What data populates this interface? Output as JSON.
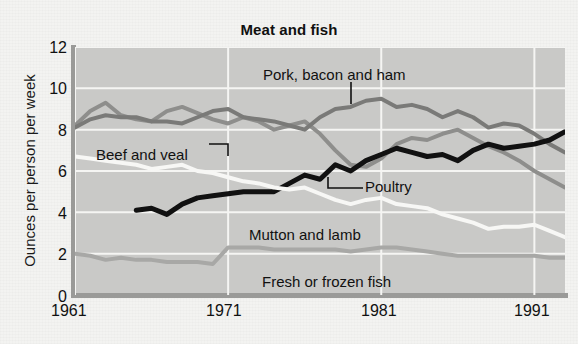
{
  "chart_data": {
    "type": "line",
    "title": "Meat and fish",
    "xlabel": "",
    "ylabel": "Ounces per person per week",
    "xlim": [
      1961,
      1993
    ],
    "ylim": [
      0,
      12
    ],
    "ytick_labels": [
      "0",
      "2",
      "4",
      "6",
      "8",
      "10",
      "12"
    ],
    "ytick_values": [
      0,
      2,
      4,
      6,
      8,
      10,
      12
    ],
    "xtick_labels": [
      "1961",
      "1971",
      "1981",
      "1991"
    ],
    "xtick_values": [
      1961,
      1971,
      1981,
      1991
    ],
    "grid": true,
    "legend_position": "inline-callouts",
    "plot_bg_color": "#c9c9c7",
    "gridline_color": "#f5f5f3",
    "x": [
      1961,
      1962,
      1963,
      1964,
      1965,
      1966,
      1967,
      1968,
      1969,
      1970,
      1971,
      1972,
      1973,
      1974,
      1975,
      1976,
      1977,
      1978,
      1979,
      1980,
      1981,
      1982,
      1983,
      1984,
      1985,
      1986,
      1987,
      1988,
      1989,
      1990,
      1991,
      1992,
      1993
    ],
    "series": [
      {
        "name": "Beef and veal",
        "color": "#8e8e8c",
        "label_anchor_year": 1968,
        "values": [
          8.2,
          8.9,
          9.3,
          8.7,
          8.5,
          8.4,
          8.9,
          9.1,
          8.8,
          8.5,
          8.3,
          8.6,
          8.4,
          8.0,
          8.2,
          8.4,
          7.8,
          7.0,
          6.3,
          6.2,
          6.6,
          7.3,
          7.6,
          7.5,
          7.8,
          8.0,
          7.6,
          7.2,
          6.9,
          6.5,
          6.0,
          5.6,
          5.2
        ]
      },
      {
        "name": "Pork, bacon and ham",
        "color": "#7a7a78",
        "label_anchor_year": 1977,
        "values": [
          8.1,
          8.5,
          8.7,
          8.6,
          8.6,
          8.4,
          8.4,
          8.3,
          8.6,
          8.9,
          9.0,
          8.6,
          8.5,
          8.4,
          8.2,
          8.0,
          8.6,
          9.0,
          9.1,
          9.4,
          9.5,
          9.1,
          9.2,
          9.0,
          8.6,
          8.9,
          8.6,
          8.1,
          8.3,
          8.2,
          7.8,
          7.3,
          6.9
        ]
      },
      {
        "name": "Poultry",
        "color": "#111111",
        "label_anchor_year": 1978,
        "values": [
          null,
          null,
          null,
          null,
          4.1,
          4.2,
          3.9,
          4.4,
          4.7,
          4.8,
          4.9,
          5.0,
          5.0,
          5.0,
          5.4,
          5.8,
          5.6,
          6.3,
          6.0,
          6.5,
          6.8,
          7.1,
          6.9,
          6.7,
          6.8,
          6.5,
          7.0,
          7.3,
          7.1,
          7.2,
          7.3,
          7.5,
          7.9
        ]
      },
      {
        "name": "Mutton and lamb",
        "color": "#f7f7f5",
        "label_anchor_year": 1981,
        "values": [
          6.7,
          6.6,
          6.5,
          6.4,
          6.3,
          6.1,
          6.2,
          6.3,
          6.0,
          5.9,
          5.7,
          5.5,
          5.4,
          5.2,
          5.1,
          5.2,
          4.9,
          4.6,
          4.4,
          4.6,
          4.7,
          4.4,
          4.3,
          4.2,
          3.9,
          3.7,
          3.5,
          3.2,
          3.3,
          3.3,
          3.4,
          3.1,
          2.8
        ]
      },
      {
        "name": "Fresh or frozen fish",
        "color": "#a8a8a6",
        "label_anchor_year": 1981,
        "values": [
          2.0,
          1.9,
          1.7,
          1.8,
          1.7,
          1.7,
          1.6,
          1.6,
          1.6,
          1.5,
          2.3,
          2.3,
          2.3,
          2.2,
          2.2,
          2.2,
          2.2,
          2.2,
          2.1,
          2.2,
          2.3,
          2.3,
          2.2,
          2.1,
          2.0,
          1.9,
          1.9,
          1.9,
          1.9,
          1.9,
          1.9,
          1.8,
          1.8
        ]
      }
    ],
    "annotations": [
      {
        "name": "beef-and-veal",
        "text": "Beef and veal",
        "x": 96,
        "y": 146
      },
      {
        "name": "pork-bacon-and-ham",
        "text": "Pork, bacon and ham",
        "x": 263,
        "y": 66
      },
      {
        "name": "poultry",
        "text": "Poultry",
        "x": 365,
        "y": 178
      },
      {
        "name": "mutton-and-lamb",
        "text": "Mutton and lamb",
        "x": 249,
        "y": 226
      },
      {
        "name": "fresh-or-frozen-fish",
        "text": "Fresh or frozen fish",
        "x": 262,
        "y": 273
      }
    ]
  }
}
